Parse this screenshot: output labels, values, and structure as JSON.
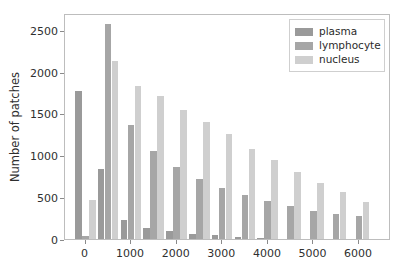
{
  "chart_data": {
    "type": "bar",
    "title": "",
    "xlabel": "",
    "ylabel": "Number of patches",
    "xlim": [
      -450,
      6700
    ],
    "ylim": [
      0,
      2700
    ],
    "xticks": [
      0,
      1000,
      2000,
      3000,
      4000,
      5000,
      6000
    ],
    "xtick_labels": [
      "0",
      "1000",
      "2000",
      "3000",
      "4000",
      "5000",
      "6000"
    ],
    "yticks": [
      0,
      500,
      1000,
      1500,
      2000,
      2500
    ],
    "ytick_labels": [
      "0",
      "500",
      "1000",
      "1500",
      "2000",
      "2500"
    ],
    "grid": false,
    "legend_position": "upper right",
    "bin_centers": [
      0,
      500,
      1000,
      1500,
      2000,
      2500,
      3000,
      3500,
      4000,
      4500,
      5000,
      5500,
      6000
    ],
    "categories": [
      "0",
      "500",
      "1000",
      "1500",
      "2000",
      "2500",
      "3000",
      "3500",
      "4000",
      "4500",
      "5000",
      "5500",
      "6000"
    ],
    "series": [
      {
        "name": "plasma",
        "color": "#9a9a9a",
        "values": [
          1765,
          840,
          225,
          135,
          100,
          65,
          45,
          25,
          8,
          0,
          0,
          0,
          0
        ]
      },
      {
        "name": "lymphocyte",
        "color": "#a6a6a6",
        "values": [
          35,
          2565,
          1360,
          1055,
          865,
          715,
          610,
          520,
          450,
          390,
          335,
          300,
          270
        ]
      },
      {
        "name": "nucleus",
        "color": "#cfcfcf",
        "values": [
          470,
          2130,
          1830,
          1710,
          1545,
          1400,
          1250,
          1080,
          945,
          805,
          675,
          565,
          440
        ]
      }
    ]
  },
  "legend": {
    "items": [
      {
        "label": "plasma"
      },
      {
        "label": "lymphocyte"
      },
      {
        "label": "nucleus"
      }
    ]
  },
  "colors": {
    "plasma": "#9a9a9a",
    "lymphocyte": "#a6a6a6",
    "nucleus": "#cfcfcf",
    "axis": "#bdbdbd",
    "text": "#2f2f2f",
    "background": "#ffffff"
  }
}
